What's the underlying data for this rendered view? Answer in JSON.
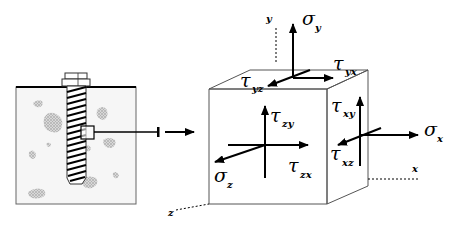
{
  "diagram": {
    "left_panel": {
      "description": "Screw anchor embedded in concrete block with aggregate",
      "detail_marker": "square"
    },
    "cube": {
      "axes": {
        "x": "x",
        "y": "y",
        "z": "z"
      },
      "top_face": {
        "normal": {
          "symbol": "σ",
          "subscript": "y"
        },
        "shear_1": {
          "symbol": "τ",
          "subscript": "yx"
        },
        "shear_2": {
          "symbol": "τ",
          "subscript": "yz"
        }
      },
      "front_face": {
        "normal": {
          "symbol": "σ",
          "subscript": "z"
        },
        "shear_1": {
          "symbol": "τ",
          "subscript": "zy"
        },
        "shear_2": {
          "symbol": "τ",
          "subscript": "zx"
        }
      },
      "right_face": {
        "normal": {
          "symbol": "σ",
          "subscript": "x"
        },
        "shear_1": {
          "symbol": "τ",
          "subscript": "xy"
        },
        "shear_2": {
          "symbol": "τ",
          "subscript": "xz"
        }
      }
    },
    "colors": {
      "line": "#000000",
      "box_edge": "#555555",
      "block_fill": "#f4f4f4",
      "aggregate": "#c8c8c8"
    }
  }
}
